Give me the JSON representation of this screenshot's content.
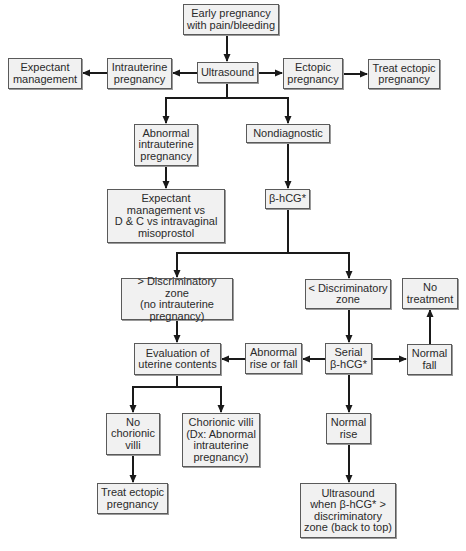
{
  "diagram": {
    "type": "flowchart",
    "topic": "Evaluation of early pregnancy with pain/bleeding",
    "nodes": [
      {
        "id": "start",
        "label": "Early pregnancy\nwith pain/bleeding",
        "x": 183,
        "y": 4,
        "w": 96,
        "h": 31
      },
      {
        "id": "ultrasound",
        "label": "Ultrasound",
        "x": 197,
        "y": 62,
        "w": 61,
        "h": 21
      },
      {
        "id": "intrauterine",
        "label": "Intrauterine\npregnancy",
        "x": 107,
        "y": 58,
        "w": 65,
        "h": 31
      },
      {
        "id": "expectant",
        "label": "Expectant\nmanagement",
        "x": 8,
        "y": 58,
        "w": 74,
        "h": 31
      },
      {
        "id": "ectopic",
        "label": "Ectopic\npregnancy",
        "x": 283,
        "y": 58,
        "w": 60,
        "h": 31
      },
      {
        "id": "treat_ectopic_top",
        "label": "Treat ectopic\npregnancy",
        "x": 368,
        "y": 59,
        "w": 72,
        "h": 30
      },
      {
        "id": "abnormal_iup",
        "label": "Abnormal\nintrauterine\npregnancy",
        "x": 134,
        "y": 124,
        "w": 64,
        "h": 42
      },
      {
        "id": "nondiagnostic",
        "label": "Nondiagnostic",
        "x": 246,
        "y": 124,
        "w": 84,
        "h": 19
      },
      {
        "id": "management_options",
        "label": "Expectant\nmanagement vs\nD & C vs intravaginal\nmisoprostol",
        "x": 107,
        "y": 189,
        "w": 118,
        "h": 54
      },
      {
        "id": "bhcg",
        "label": "β-hCG*",
        "x": 265,
        "y": 189,
        "w": 45,
        "h": 20
      },
      {
        "id": "above_dz",
        "label": "> Discriminatory zone\n(no intrauterine\npregnancy)",
        "x": 121,
        "y": 278,
        "w": 112,
        "h": 42
      },
      {
        "id": "below_dz",
        "label": "< Discriminatory\nzone",
        "x": 305,
        "y": 279,
        "w": 86,
        "h": 30
      },
      {
        "id": "no_treatment",
        "label": "No\ntreatment",
        "x": 402,
        "y": 278,
        "w": 56,
        "h": 31
      },
      {
        "id": "evaluation",
        "label": "Evaluation of\nuterine contents",
        "x": 134,
        "y": 343,
        "w": 87,
        "h": 32
      },
      {
        "id": "abnormal_rise_fall",
        "label": "Abnormal\nrise or fall",
        "x": 245,
        "y": 343,
        "w": 57,
        "h": 31
      },
      {
        "id": "serial_bhcg",
        "label": "Serial\nβ-hCG*",
        "x": 325,
        "y": 343,
        "w": 47,
        "h": 31
      },
      {
        "id": "normal_fall",
        "label": "Normal\nfall",
        "x": 407,
        "y": 344,
        "w": 45,
        "h": 31
      },
      {
        "id": "no_villi",
        "label": "No\nchorionic\nvilli",
        "x": 106,
        "y": 413,
        "w": 54,
        "h": 42
      },
      {
        "id": "villi",
        "label": "Chorionic villi\n(Dx: Abnormal\nintrauterine\npregnancy)",
        "x": 182,
        "y": 413,
        "w": 78,
        "h": 54
      },
      {
        "id": "normal_rise",
        "label": "Normal\nrise",
        "x": 326,
        "y": 413,
        "w": 45,
        "h": 31
      },
      {
        "id": "treat_ectopic_bottom",
        "label": "Treat ectopic\npregnancy",
        "x": 97,
        "y": 483,
        "w": 71,
        "h": 31
      },
      {
        "id": "ultrasound_when",
        "label": "Ultrasound\nwhen β-hCG* >\ndiscriminatory\nzone (back to top)",
        "x": 300,
        "y": 483,
        "w": 96,
        "h": 55
      }
    ],
    "edges": [
      {
        "from": "start",
        "to": "ultrasound"
      },
      {
        "from": "ultrasound",
        "to": "intrauterine"
      },
      {
        "from": "intrauterine",
        "to": "expectant"
      },
      {
        "from": "ultrasound",
        "to": "ectopic"
      },
      {
        "from": "ectopic",
        "to": "treat_ectopic_top"
      },
      {
        "from": "ultrasound",
        "to": "abnormal_iup"
      },
      {
        "from": "ultrasound",
        "to": "nondiagnostic"
      },
      {
        "from": "abnormal_iup",
        "to": "management_options"
      },
      {
        "from": "nondiagnostic",
        "to": "bhcg"
      },
      {
        "from": "bhcg",
        "to": "above_dz"
      },
      {
        "from": "bhcg",
        "to": "below_dz"
      },
      {
        "from": "above_dz",
        "to": "evaluation"
      },
      {
        "from": "below_dz",
        "to": "serial_bhcg"
      },
      {
        "from": "serial_bhcg",
        "to": "abnormal_rise_fall"
      },
      {
        "from": "abnormal_rise_fall",
        "to": "evaluation"
      },
      {
        "from": "serial_bhcg",
        "to": "normal_fall"
      },
      {
        "from": "normal_fall",
        "to": "no_treatment"
      },
      {
        "from": "serial_bhcg",
        "to": "normal_rise"
      },
      {
        "from": "normal_rise",
        "to": "ultrasound_when"
      },
      {
        "from": "evaluation",
        "to": "no_villi"
      },
      {
        "from": "evaluation",
        "to": "villi"
      },
      {
        "from": "no_villi",
        "to": "treat_ectopic_bottom"
      }
    ]
  },
  "colors": {
    "box_fill": "#f1f1f1",
    "box_border": "#5a5a5a",
    "line": "#1a1a1a",
    "text": "#2a2a2a"
  }
}
